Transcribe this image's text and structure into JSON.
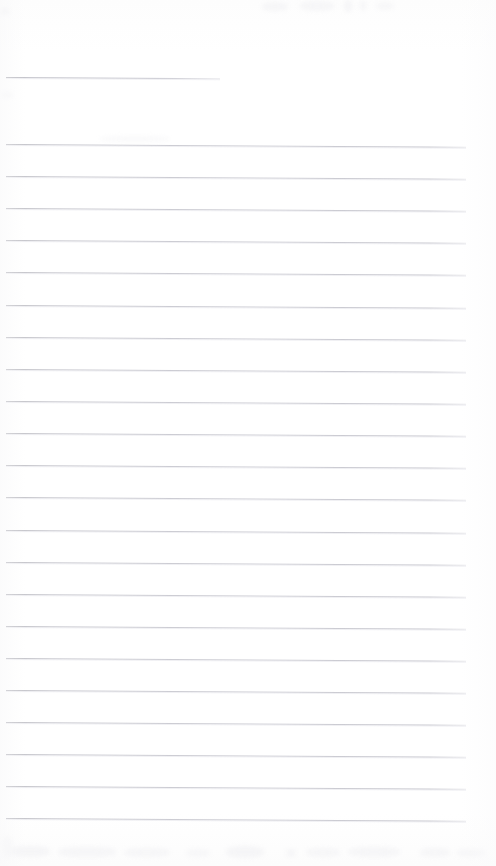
{
  "document": {
    "kind": "scanned-ruled-notebook-page",
    "title": "Blank ruled notebook page",
    "content_text": "",
    "page_width": 496,
    "page_height": 866
  },
  "colors": {
    "page_background": "#fefefe",
    "paper_white": "#ffffff",
    "rule_line": "#c6c6cd",
    "rule_line_dark": "#afafb6",
    "rule_halo": "#e4e4e9",
    "smudge": "#f4f4f6"
  },
  "ruling": {
    "line_spacing_px": 32,
    "skew_degrees": 0.33,
    "left_margin_px": 6,
    "right_edge_px": 466,
    "header_rule": {
      "label": "header-rule",
      "y": 77,
      "x": 6,
      "width": 214
    },
    "body_rules": [
      {
        "label": "rule-1",
        "y": 144
      },
      {
        "label": "rule-2",
        "y": 176
      },
      {
        "label": "rule-3",
        "y": 208
      },
      {
        "label": "rule-4",
        "y": 240
      },
      {
        "label": "rule-5",
        "y": 272
      },
      {
        "label": "rule-6",
        "y": 305
      },
      {
        "label": "rule-7",
        "y": 337
      },
      {
        "label": "rule-8",
        "y": 369
      },
      {
        "label": "rule-9",
        "y": 401
      },
      {
        "label": "rule-10",
        "y": 433
      },
      {
        "label": "rule-11",
        "y": 465
      },
      {
        "label": "rule-12",
        "y": 497
      },
      {
        "label": "rule-13",
        "y": 530
      },
      {
        "label": "rule-14",
        "y": 562
      },
      {
        "label": "rule-15",
        "y": 594
      },
      {
        "label": "rule-16",
        "y": 626
      },
      {
        "label": "rule-17",
        "y": 658
      },
      {
        "label": "rule-18",
        "y": 690
      },
      {
        "label": "rule-19",
        "y": 722
      },
      {
        "label": "rule-20",
        "y": 754
      },
      {
        "label": "rule-21",
        "y": 786
      },
      {
        "label": "rule-22",
        "y": 818
      }
    ]
  },
  "artifacts": {
    "smudges": [
      {
        "label": "smudge-top-1",
        "x": 262,
        "y": 2,
        "w": 26,
        "h": 9,
        "opacity": 0.75
      },
      {
        "label": "smudge-top-2",
        "x": 300,
        "y": 1,
        "w": 34,
        "h": 10,
        "opacity": 0.7
      },
      {
        "label": "smudge-top-3",
        "x": 344,
        "y": 0,
        "w": 8,
        "h": 12,
        "opacity": 0.8
      },
      {
        "label": "smudge-top-4",
        "x": 360,
        "y": 0,
        "w": 6,
        "h": 11,
        "opacity": 0.7
      },
      {
        "label": "smudge-top-5",
        "x": 376,
        "y": 2,
        "w": 18,
        "h": 8,
        "opacity": 0.6
      },
      {
        "label": "smudge-left-1",
        "x": 0,
        "y": 8,
        "w": 9,
        "h": 7,
        "opacity": 0.8
      },
      {
        "label": "smudge-left-2",
        "x": 1,
        "y": 92,
        "w": 12,
        "h": 6,
        "opacity": 0.5
      },
      {
        "label": "smudge-mid-1",
        "x": 100,
        "y": 136,
        "w": 70,
        "h": 6,
        "opacity": 0.45
      },
      {
        "label": "smudge-bot-1",
        "x": 10,
        "y": 846,
        "w": 40,
        "h": 11,
        "opacity": 0.8
      },
      {
        "label": "smudge-bot-2",
        "x": 58,
        "y": 847,
        "w": 58,
        "h": 10,
        "opacity": 0.75
      },
      {
        "label": "smudge-bot-3",
        "x": 124,
        "y": 848,
        "w": 46,
        "h": 9,
        "opacity": 0.7
      },
      {
        "label": "smudge-bot-4",
        "x": 186,
        "y": 849,
        "w": 24,
        "h": 8,
        "opacity": 0.65
      },
      {
        "label": "smudge-bot-5",
        "x": 226,
        "y": 846,
        "w": 38,
        "h": 12,
        "opacity": 0.8
      },
      {
        "label": "smudge-bot-6",
        "x": 286,
        "y": 849,
        "w": 10,
        "h": 8,
        "opacity": 0.7
      },
      {
        "label": "smudge-bot-7",
        "x": 306,
        "y": 848,
        "w": 34,
        "h": 9,
        "opacity": 0.7
      },
      {
        "label": "smudge-bot-8",
        "x": 348,
        "y": 847,
        "w": 52,
        "h": 10,
        "opacity": 0.75
      },
      {
        "label": "smudge-bot-9",
        "x": 420,
        "y": 848,
        "w": 30,
        "h": 9,
        "opacity": 0.7
      },
      {
        "label": "smudge-bot-10",
        "x": 456,
        "y": 849,
        "w": 30,
        "h": 8,
        "opacity": 0.65
      },
      {
        "label": "smudge-bot-edge",
        "x": 2,
        "y": 836,
        "w": 10,
        "h": 22,
        "opacity": 0.55
      }
    ]
  }
}
